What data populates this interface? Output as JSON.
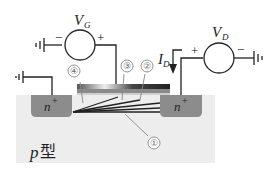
{
  "diagram": {
    "gate_source": {
      "label": "V",
      "subscript": "G",
      "minus": "−",
      "plus": "+"
    },
    "drain_source": {
      "label": "V",
      "subscript": "D",
      "minus": "−",
      "plus": "+"
    },
    "current": {
      "label": "I",
      "subscript": "D"
    },
    "source_region": {
      "label": "n",
      "superscript": "+"
    },
    "drain_region": {
      "label": "n",
      "superscript": "+"
    },
    "substrate": {
      "label": "p",
      "suffix": "型"
    },
    "callouts": [
      "①",
      "②",
      "③",
      "④"
    ],
    "colors": {
      "substrate": "#ededed",
      "n_region": "#8c8c8c",
      "gate_metal": "#3a3a3a",
      "oxide": "#e0e0e0",
      "wire": "#222222",
      "callout": "#777777"
    }
  }
}
